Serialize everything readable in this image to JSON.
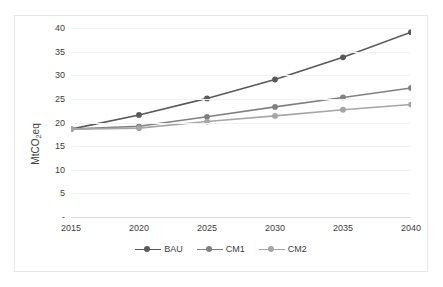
{
  "chart_data": {
    "type": "line",
    "title": "",
    "xlabel": "",
    "ylabel": "MtCO2eq",
    "ylabel_parts": {
      "pre": "MtCO",
      "sub": "2",
      "post": "eq"
    },
    "x": [
      2015,
      2020,
      2025,
      2030,
      2035,
      2040
    ],
    "categories": [
      "2015",
      "2020",
      "2025",
      "2030",
      "2035",
      "2040"
    ],
    "xlim": [
      2015,
      2040
    ],
    "ylim": [
      0,
      40
    ],
    "yticks": [
      0,
      5,
      10,
      15,
      20,
      25,
      30,
      35,
      40
    ],
    "ytick_labels": [
      "-",
      "5",
      "10",
      "15",
      "20",
      "25",
      "30",
      "35",
      "40"
    ],
    "grid": true,
    "legend_position": "bottom",
    "series": [
      {
        "name": "BAU",
        "color": "#595959",
        "values": [
          18.6,
          21.6,
          25.1,
          29.1,
          33.8,
          39.1
        ]
      },
      {
        "name": "CM1",
        "color": "#808080",
        "values": [
          18.6,
          19.2,
          21.2,
          23.3,
          25.3,
          27.3
        ]
      },
      {
        "name": "CM2",
        "color": "#a6a6a6",
        "values": [
          18.6,
          18.8,
          20.2,
          21.4,
          22.7,
          23.8
        ]
      }
    ]
  },
  "legend": {
    "items": [
      {
        "label": "BAU",
        "color": "#595959"
      },
      {
        "label": "CM1",
        "color": "#808080"
      },
      {
        "label": "CM2",
        "color": "#a6a6a6"
      }
    ]
  },
  "colors": {
    "grid": "#f2f2f2",
    "axis": "#d9d9d9",
    "border": "#e8e8e8",
    "text": "#404040",
    "background": "#ffffff"
  }
}
